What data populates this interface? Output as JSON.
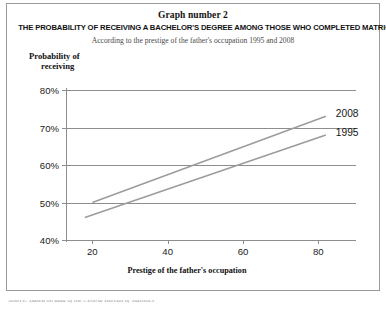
{
  "figure": {
    "graph_number": "Graph number 2",
    "main_title": "THE PROBABILITY OF RECEIVING A BACHELOR'S DEGREE AMONG THOSE WHO COMPLETED MATRICULATION",
    "subtitle": "According to the prestige of the father's occupation 1995 and 2008",
    "bottom_caption": "Source: Based on data of the Central Bureau of Statistics",
    "border_color": "#9a9a9a",
    "line_color": "#9c9c9c",
    "axis_color": "#8d8d8d"
  },
  "chart_data": {
    "type": "line",
    "title": "THE PROBABILITY OF RECEIVING A BACHELOR'S DEGREE AMONG THOSE WHO COMPLETED MATRICULATION",
    "subtitle": "According to the prestige of the father's occupation 1995 and 2008",
    "xlabel": "Prestige of the father's occupation",
    "ylabel": "Probability of receiving",
    "ylabel_lines": [
      "Probability of",
      "receiving"
    ],
    "xlim": [
      13,
      90
    ],
    "ylim": [
      40,
      80
    ],
    "xticks": [
      20,
      40,
      60,
      80
    ],
    "xtick_labels": [
      "20",
      "40",
      "60",
      "80"
    ],
    "yticks": [
      40,
      50,
      60,
      70,
      80
    ],
    "ytick_labels": [
      "40%",
      "50%",
      "60%",
      "70%",
      "80%"
    ],
    "grid": "horizontal",
    "legend_position": "inline-right-of-line-ends",
    "series": [
      {
        "name": "2008",
        "label": "2008",
        "x": [
          20,
          82
        ],
        "values": [
          50,
          73
        ]
      },
      {
        "name": "1995",
        "label": "1995",
        "x": [
          18,
          82
        ],
        "values": [
          46,
          68
        ]
      }
    ]
  }
}
